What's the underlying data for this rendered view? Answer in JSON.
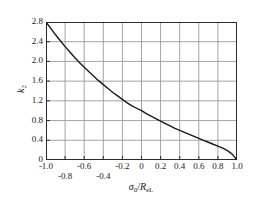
{
  "figure": {
    "background_color": "#ffffff",
    "axis_color": "#2b2b2b",
    "grid_color": "#9a9a9a",
    "curve_color": "#1a1a1a"
  },
  "axis_titles": {
    "x_prefix": "σ",
    "x_sub": "0",
    "x_mid": "/",
    "x_R": "R",
    "x_R_sub": "eL",
    "y_symbol": "k",
    "y_sub": "2"
  },
  "chart_data": {
    "type": "line",
    "title": "",
    "subtitle": "",
    "xlabel": "σ0/ReL",
    "ylabel": "k2",
    "xlim": [
      -1.0,
      1.0
    ],
    "ylim": [
      0,
      2.8
    ],
    "grid": true,
    "legend": null,
    "xticks": [
      -1.0,
      -0.8,
      -0.6,
      -0.4,
      -0.2,
      0,
      0.2,
      0.4,
      0.6,
      0.8,
      1.0
    ],
    "xtick_labels": [
      "-1.0",
      "-0.8",
      "-0.6",
      "-0.4",
      "-0.2",
      "0",
      "0.2",
      "0.4",
      "0.6",
      "0.8",
      "1.0"
    ],
    "xtick_label_rows": [
      0,
      1,
      0,
      1,
      0,
      0,
      0,
      0,
      0,
      0,
      0
    ],
    "yticks": [
      0,
      0.4,
      0.8,
      1.2,
      1.6,
      2.0,
      2.4,
      2.8
    ],
    "ytick_labels": [
      "0",
      "0.4",
      "0.8",
      "1.2",
      "1.6",
      "2.0",
      "2.4",
      "2.8"
    ],
    "series": [
      {
        "name": "k2",
        "x": [
          -1.0,
          -0.95,
          -0.9,
          -0.85,
          -0.8,
          -0.75,
          -0.7,
          -0.65,
          -0.6,
          -0.55,
          -0.5,
          -0.45,
          -0.4,
          -0.35,
          -0.3,
          -0.25,
          -0.2,
          -0.15,
          -0.1,
          -0.05,
          0.0,
          0.05,
          0.1,
          0.15,
          0.2,
          0.25,
          0.3,
          0.35,
          0.4,
          0.45,
          0.5,
          0.55,
          0.6,
          0.65,
          0.7,
          0.75,
          0.8,
          0.85,
          0.9,
          0.95,
          1.0
        ],
        "y": [
          2.8,
          2.67,
          2.54,
          2.42,
          2.3,
          2.19,
          2.08,
          1.98,
          1.88,
          1.79,
          1.7,
          1.61,
          1.53,
          1.45,
          1.37,
          1.3,
          1.23,
          1.16,
          1.1,
          1.05,
          1.0,
          0.94,
          0.89,
          0.84,
          0.79,
          0.74,
          0.69,
          0.64,
          0.6,
          0.56,
          0.52,
          0.48,
          0.44,
          0.4,
          0.36,
          0.32,
          0.28,
          0.24,
          0.19,
          0.12,
          0.0
        ]
      }
    ]
  }
}
